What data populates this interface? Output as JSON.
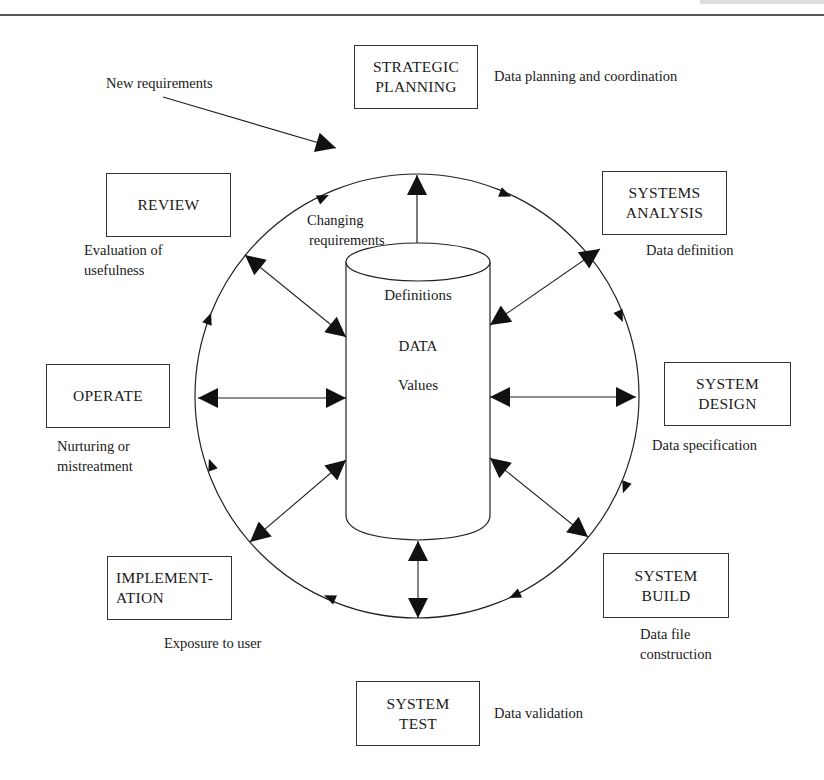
{
  "header": {
    "cropped_text": "Introduction"
  },
  "diagram": {
    "central_store": {
      "top_label": "Definitions",
      "middle_label": "DATA",
      "bottom_label": "Values"
    },
    "inputs": {
      "new_requirements": "New requirements",
      "changing_requirements_line1": "Changing",
      "changing_requirements_line2": "requirements"
    },
    "stages": [
      {
        "id": "strategic-planning",
        "line1": "STRATEGIC",
        "line2": "PLANNING",
        "note_line1": "Data planning and coordination",
        "note_line2": ""
      },
      {
        "id": "systems-analysis",
        "line1": "SYSTEMS",
        "line2": "ANALYSIS",
        "note_line1": "Data definition",
        "note_line2": ""
      },
      {
        "id": "system-design",
        "line1": "SYSTEM",
        "line2": "DESIGN",
        "note_line1": "Data specification",
        "note_line2": ""
      },
      {
        "id": "system-build",
        "line1": "SYSTEM",
        "line2": "BUILD",
        "note_line1": "Data file",
        "note_line2": "construction"
      },
      {
        "id": "system-test",
        "line1": "SYSTEM",
        "line2": "TEST",
        "note_line1": "Data validation",
        "note_line2": ""
      },
      {
        "id": "implementation",
        "line1": "IMPLEMENT-",
        "line2": "ATION",
        "note_line1": "Exposure to user",
        "note_line2": ""
      },
      {
        "id": "operate",
        "line1": "OPERATE",
        "line2": "",
        "note_line1": "Nurturing or",
        "note_line2": "mistreatment"
      },
      {
        "id": "review",
        "line1": "REVIEW",
        "line2": "",
        "note_line1": "Evaluation of",
        "note_line2": "usefulness"
      }
    ],
    "colors": {
      "ink": "#1a1a1a",
      "background": "#ffffff"
    }
  }
}
